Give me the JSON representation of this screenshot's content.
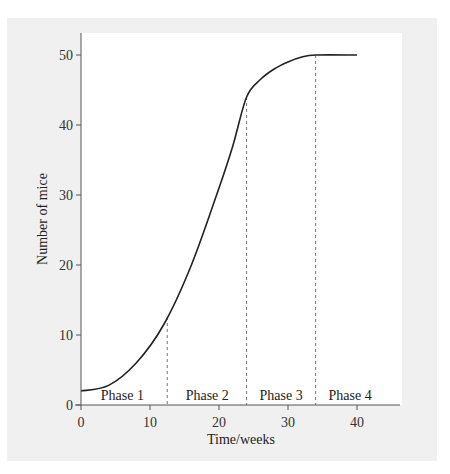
{
  "chart_data": {
    "type": "line",
    "title": "",
    "xlabel": "Time/weeks",
    "ylabel": "Number of mice",
    "xlim": [
      0,
      45
    ],
    "ylim": [
      0,
      52
    ],
    "x_ticks": [
      0,
      10,
      20,
      30,
      40
    ],
    "y_ticks": [
      0,
      10,
      20,
      30,
      40,
      50
    ],
    "grid": false,
    "legend": null,
    "series": [
      {
        "name": "Mouse population",
        "x": [
          0,
          4,
          8,
          12,
          16,
          20,
          22,
          24,
          26,
          28,
          30,
          32,
          34,
          40
        ],
        "values": [
          2,
          2.8,
          6,
          11.5,
          20,
          31,
          37,
          44,
          46.5,
          48,
          49,
          49.7,
          50,
          50
        ]
      }
    ],
    "phase_boundaries": [
      12.5,
      24,
      34
    ],
    "annotations": [
      {
        "text": "Phase 1",
        "x": 6
      },
      {
        "text": "Phase 2",
        "x": 18.3
      },
      {
        "text": "Phase 3",
        "x": 29
      },
      {
        "text": "Phase 4",
        "x": 39
      }
    ]
  },
  "colors": {
    "frame_bg": "#f0f0f0",
    "plot_bg": "#ffffff",
    "curve": "#222222",
    "dash": "#777777"
  }
}
